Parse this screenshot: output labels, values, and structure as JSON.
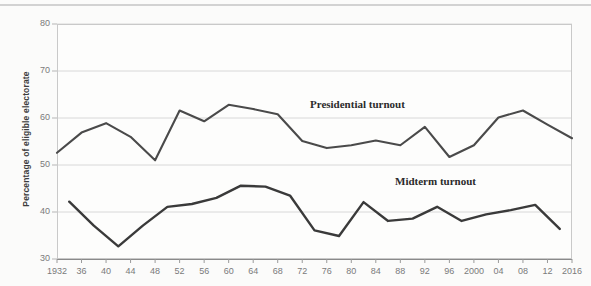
{
  "chart_data": {
    "type": "line",
    "title": "",
    "xlabel": "",
    "ylabel": "Percentage of eligible electorate",
    "ylim": [
      30,
      80
    ],
    "xlim": [
      1932,
      2016
    ],
    "grid": true,
    "legend_position": "inline-annotation",
    "y_ticks": [
      "80",
      "70",
      "60",
      "50",
      "40",
      "30"
    ],
    "y_tick_values": [
      80,
      70,
      60,
      50,
      40,
      30
    ],
    "x_ticks": [
      "1932",
      "36",
      "40",
      "44",
      "48",
      "52",
      "56",
      "60",
      "64",
      "68",
      "72",
      "76",
      "80",
      "84",
      "88",
      "92",
      "96",
      "2000",
      "04",
      "08",
      "12",
      "2016"
    ],
    "x_tick_values": [
      1932,
      1936,
      1940,
      1944,
      1948,
      1952,
      1956,
      1960,
      1964,
      1968,
      1972,
      1976,
      1980,
      1984,
      1988,
      1992,
      1996,
      2000,
      2004,
      2008,
      2012,
      2016
    ],
    "series": [
      {
        "name": "Presidential turnout",
        "color": "#4a4a4a",
        "annotation": "Presidential turnout",
        "x": [
          1932,
          1936,
          1940,
          1944,
          1948,
          1952,
          1956,
          1960,
          1964,
          1968,
          1972,
          1976,
          1980,
          1984,
          1988,
          1992,
          1996,
          2000,
          2004,
          2008,
          2012,
          2016
        ],
        "values": [
          52.6,
          56.9,
          58.9,
          56.0,
          51.0,
          61.6,
          59.3,
          62.8,
          61.9,
          60.8,
          55.1,
          53.6,
          54.2,
          55.2,
          54.2,
          58.1,
          51.7,
          54.2,
          60.1,
          61.6,
          58.6,
          55.7
        ]
      },
      {
        "name": "Midterm turnout",
        "color": "#3a3a3a",
        "annotation": "Midterm turnout",
        "x": [
          1934,
          1938,
          1942,
          1946,
          1950,
          1954,
          1958,
          1962,
          1966,
          1970,
          1974,
          1978,
          1982,
          1986,
          1990,
          1994,
          1998,
          2002,
          2006,
          2010,
          2014
        ],
        "values": [
          42.2,
          37.1,
          32.7,
          37.1,
          41.1,
          41.7,
          43.0,
          45.6,
          45.4,
          43.5,
          36.1,
          34.9,
          42.1,
          38.1,
          38.6,
          41.1,
          38.1,
          39.5,
          40.4,
          41.5,
          36.4
        ]
      }
    ],
    "annotations": [
      {
        "text": "Presidential turnout",
        "x_px": 310,
        "y_px": 98
      },
      {
        "text": "Midterm turnout",
        "x_px": 395,
        "y_px": 175
      }
    ]
  },
  "plot_area": {
    "left": 57,
    "top": 24,
    "right": 572,
    "bottom": 259
  }
}
